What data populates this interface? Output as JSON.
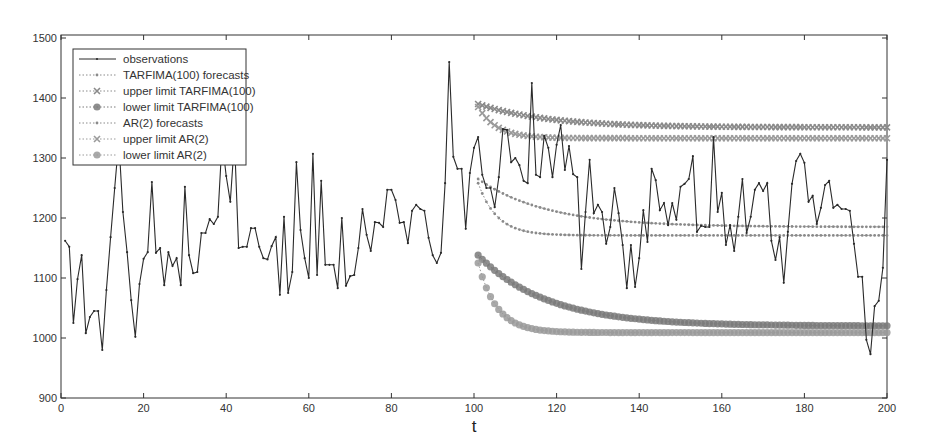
{
  "chart_data": {
    "type": "line",
    "title": "",
    "xlabel": "t",
    "ylabel": "",
    "xlim": [
      0,
      200
    ],
    "ylim": [
      900,
      1500
    ],
    "grid": false,
    "legend_position": "top-left",
    "x_ticks": [
      0,
      20,
      40,
      60,
      80,
      100,
      120,
      140,
      160,
      180,
      200
    ],
    "y_ticks": [
      900,
      1000,
      1100,
      1200,
      1300,
      1400,
      1500
    ],
    "series": [
      {
        "name": "observations",
        "style": "solid-line-dot",
        "color": "#2a2a2a",
        "x_start": 1,
        "values": [
          1162,
          1152,
          1025,
          1098,
          1138,
          1008,
          1035,
          1045,
          1045,
          980,
          1080,
          1168,
          1250,
          1330,
          1210,
          1143,
          1063,
          1002,
          1090,
          1132,
          1143,
          1260,
          1142,
          1150,
          1088,
          1143,
          1120,
          1133,
          1088,
          1252,
          1138,
          1108,
          1110,
          1175,
          1175,
          1198,
          1190,
          1202,
          1330,
          1270,
          1227,
          1330,
          1150,
          1152,
          1152,
          1183,
          1183,
          1152,
          1133,
          1131,
          1153,
          1168,
          1072,
          1202,
          1075,
          1110,
          1293,
          1180,
          1133,
          1100,
          1307,
          1105,
          1262,
          1122,
          1122,
          1122,
          1083,
          1200,
          1087,
          1103,
          1105,
          1150,
          1215,
          1172,
          1145,
          1193,
          1192,
          1185,
          1247,
          1247,
          1230,
          1192,
          1193,
          1158,
          1212,
          1222,
          1215,
          1212,
          1167,
          1138,
          1125,
          1142,
          1258,
          1460,
          1302,
          1282,
          1282,
          1182,
          1275,
          1317,
          1335,
          1272,
          1250,
          1250,
          1218,
          1268,
          1348,
          1347,
          1293,
          1300,
          1288,
          1262,
          1258,
          1425,
          1272,
          1268,
          1337,
          1317,
          1268,
          1322,
          1355,
          1280,
          1320,
          1273,
          1268,
          1115,
          1210,
          1297,
          1208,
          1222,
          1210,
          1157,
          1185,
          1250,
          1208,
          1155,
          1083,
          1155,
          1085,
          1133,
          1213,
          1160,
          1282,
          1263,
          1213,
          1225,
          1188,
          1225,
          1197,
          1252,
          1257,
          1265,
          1303,
          1177,
          1187,
          1185,
          1185,
          1335,
          1210,
          1242,
          1155,
          1188,
          1145,
          1202,
          1265,
          1175,
          1202,
          1247,
          1258,
          1245,
          1258,
          1162,
          1130,
          1168,
          1092,
          1177,
          1257,
          1295,
          1307,
          1292,
          1227,
          1237,
          1190,
          1217,
          1255,
          1262,
          1217,
          1222,
          1215,
          1215,
          1212,
          1157,
          1102,
          1102,
          997,
          973,
          1053,
          1062,
          1117,
          1297
        ]
      },
      {
        "name": "TARFIMA(100) forecasts",
        "style": "dotted-dot",
        "color": "#8a8a8a",
        "x_start": 101,
        "x_end": 200,
        "curve": {
          "start": 1265,
          "end": 1185,
          "decay": 0.06
        }
      },
      {
        "name": "upper limit TARFIMA(100)",
        "style": "dotted-x",
        "color": "#8a8a8a",
        "x_start": 101,
        "x_end": 200,
        "curve": {
          "start": 1390,
          "end": 1351,
          "decay": 0.06
        }
      },
      {
        "name": "lower limit TARFIMA(100)",
        "style": "dotted-star",
        "color": "#7a7a7a",
        "x_start": 101,
        "x_end": 200,
        "curve": {
          "start": 1138,
          "end": 1020,
          "decay": 0.06
        }
      },
      {
        "name": "AR(2) forecasts",
        "style": "dotted-dot",
        "color": "#8a8a8a",
        "x_start": 101,
        "x_end": 200,
        "curve": {
          "start": 1258,
          "end": 1171,
          "decay": 0.22
        }
      },
      {
        "name": "upper limit AR(2)",
        "style": "dotted-x",
        "color": "#9a9a9a",
        "x_start": 101,
        "x_end": 200,
        "curve": {
          "start": 1385,
          "end": 1333,
          "decay": 0.22
        }
      },
      {
        "name": "lower limit AR(2)",
        "style": "dotted-star",
        "color": "#9a9a9a",
        "x_start": 101,
        "x_end": 200,
        "curve": {
          "start": 1125,
          "end": 1009,
          "decay": 0.22
        }
      }
    ]
  }
}
